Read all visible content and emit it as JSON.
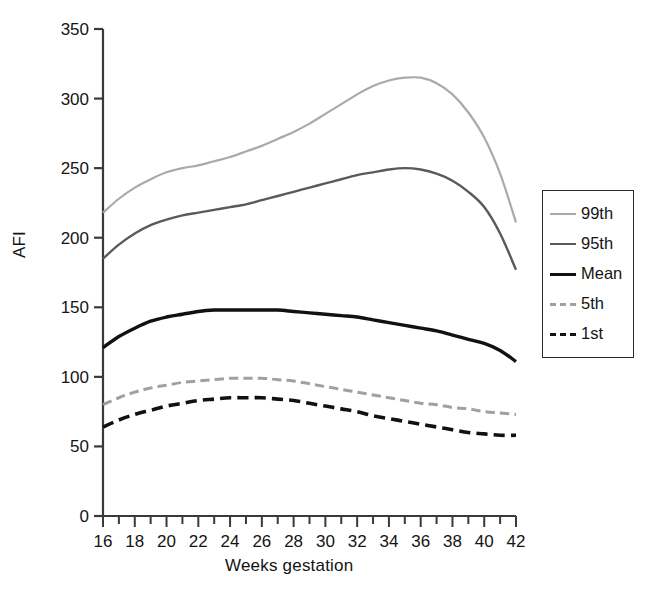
{
  "chart_data": {
    "type": "line",
    "title": "",
    "xlabel": "Weeks gestation",
    "ylabel": "AFI",
    "xlim": [
      16,
      42
    ],
    "ylim": [
      0,
      350
    ],
    "xticks": [
      16,
      17,
      18,
      19,
      20,
      21,
      22,
      23,
      24,
      25,
      26,
      27,
      28,
      29,
      30,
      31,
      32,
      33,
      34,
      35,
      36,
      37,
      38,
      39,
      40,
      41,
      42
    ],
    "xtick_labels": [
      "16",
      "",
      "18",
      "",
      "20",
      "",
      "22",
      "",
      "24",
      "",
      "26",
      "",
      "28",
      "",
      "30",
      "",
      "32",
      "",
      "34",
      "",
      "36",
      "",
      "38",
      "",
      "40",
      "",
      "42"
    ],
    "yticks": [
      0,
      50,
      100,
      150,
      200,
      250,
      300,
      350
    ],
    "ytick_labels": [
      "0",
      "50",
      "100",
      "150",
      "200",
      "250",
      "300",
      "350"
    ],
    "grid": false,
    "legend_position": "right-middle",
    "x": [
      16,
      17,
      18,
      19,
      20,
      21,
      22,
      23,
      24,
      25,
      26,
      27,
      28,
      29,
      30,
      31,
      32,
      33,
      34,
      35,
      36,
      37,
      38,
      39,
      40,
      41,
      42
    ],
    "series": [
      {
        "name": "99th",
        "color": "#aaaaaa",
        "dash": "solid",
        "width": 2.2,
        "values": [
          218,
          228,
          236,
          242,
          247,
          250,
          252,
          255,
          258,
          262,
          266,
          271,
          276,
          282,
          289,
          296,
          303,
          309,
          313,
          315,
          315,
          311,
          303,
          290,
          272,
          246,
          211
        ]
      },
      {
        "name": "95th",
        "color": "#5a5a5a",
        "dash": "solid",
        "width": 2.4,
        "values": [
          185,
          195,
          203,
          209,
          213,
          216,
          218,
          220,
          222,
          224,
          227,
          230,
          233,
          236,
          239,
          242,
          245,
          247,
          249,
          250,
          249,
          246,
          241,
          233,
          222,
          203,
          177
        ]
      },
      {
        "name": "Mean",
        "color": "#111111",
        "dash": "solid",
        "width": 3.4,
        "values": [
          121,
          129,
          135,
          140,
          143,
          145,
          147,
          148,
          148,
          148,
          148,
          148,
          147,
          146,
          145,
          144,
          143,
          141,
          139,
          137,
          135,
          133,
          130,
          127,
          124,
          119,
          111
        ]
      },
      {
        "name": "5th",
        "color": "#a0a0a0",
        "dash": "dashed",
        "width": 3.0,
        "values": [
          80,
          85,
          89,
          92,
          94,
          96,
          97,
          98,
          99,
          99,
          99,
          98,
          97,
          95,
          93,
          91,
          89,
          87,
          85,
          83,
          81,
          80,
          78,
          77,
          75,
          74,
          73
        ]
      },
      {
        "name": "1st",
        "color": "#111111",
        "dash": "dashed",
        "width": 3.6,
        "values": [
          64,
          69,
          73,
          76,
          79,
          81,
          83,
          84,
          85,
          85,
          85,
          84,
          83,
          81,
          79,
          77,
          75,
          72,
          70,
          68,
          66,
          64,
          62,
          60,
          59,
          58,
          58
        ]
      }
    ]
  },
  "legend": {
    "items": [
      {
        "label": "99th"
      },
      {
        "label": "95th"
      },
      {
        "label": "Mean"
      },
      {
        "label": "5th"
      },
      {
        "label": "1st"
      }
    ]
  },
  "axes": {
    "x_title": "Weeks gestation",
    "y_title": "AFI"
  }
}
